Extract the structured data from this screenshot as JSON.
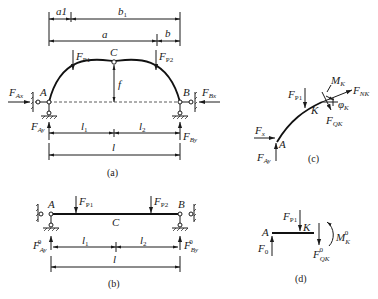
{
  "figure": {
    "panels": [
      {
        "id": "a",
        "caption": "(a)",
        "description": "Three-hinged arch with supports A and B, crown hinge C, loads FP1 and FP2"
      },
      {
        "id": "b",
        "caption": "(b)",
        "description": "Equivalent simply supported beam with same loads"
      },
      {
        "id": "c",
        "caption": "(c)",
        "description": "Free body of arch segment A-K"
      },
      {
        "id": "d",
        "caption": "(d)",
        "description": "Free body of beam segment A-K"
      }
    ],
    "panel_a": {
      "dims_top": [
        "a1",
        "b1"
      ],
      "dims_mid": [
        "a",
        "b"
      ],
      "crown": "C",
      "rise": "f",
      "support_left": "A",
      "support_right": "B",
      "loads": [
        "F",
        "F"
      ],
      "load_subs": [
        "P1",
        "P2"
      ],
      "reactions": {
        "Ax": "Ax",
        "Ay": "Ay",
        "Bx": "Bx",
        "By": "By"
      },
      "spans": [
        "l",
        "l"
      ],
      "span_subs": [
        "1",
        "2"
      ],
      "total_span": "l"
    },
    "panel_b": {
      "support_left": "A",
      "support_right": "B",
      "mid": "C",
      "reactions": {
        "Ay": "Ay",
        "By": "By"
      },
      "sup": "0",
      "spans": [
        "l",
        "l"
      ],
      "span_subs": [
        "1",
        "2"
      ],
      "total_span": "l"
    },
    "panel_c": {
      "point_A": "A",
      "point_K": "K",
      "forces": [
        "Fx",
        "FAy",
        "FP1",
        "FQK",
        "FNK",
        "MK"
      ],
      "angle": "φK"
    },
    "panel_d": {
      "point_A": "A",
      "point_K": "K",
      "forces": [
        "F0",
        "FP1",
        "FQK0",
        "MK0"
      ]
    }
  }
}
